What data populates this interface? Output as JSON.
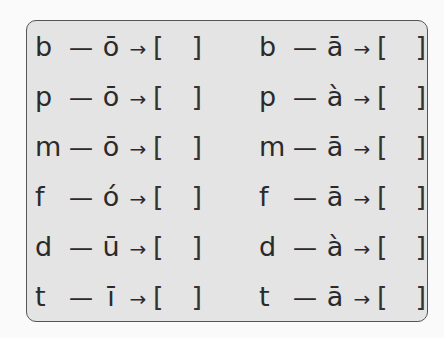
{
  "exercise": {
    "left_column": [
      {
        "initial": "b",
        "dash": "—",
        "final": "ō",
        "arrow": "→",
        "open": "[",
        "close": "]"
      },
      {
        "initial": "p",
        "dash": "—",
        "final": "ō",
        "arrow": "→",
        "open": "[",
        "close": "]"
      },
      {
        "initial": "m",
        "dash": "—",
        "final": "ō",
        "arrow": "→",
        "open": "[",
        "close": "]"
      },
      {
        "initial": "f",
        "dash": "—",
        "final": "ó",
        "arrow": "→",
        "open": "[",
        "close": "]"
      },
      {
        "initial": "d",
        "dash": "—",
        "final": "ū",
        "arrow": "→",
        "open": "[",
        "close": "]"
      },
      {
        "initial": "t",
        "dash": "—",
        "final": "ī",
        "arrow": "→",
        "open": "[",
        "close": "]"
      }
    ],
    "right_column": [
      {
        "initial": "b",
        "dash": "—",
        "final": "ā",
        "arrow": "→",
        "open": "[",
        "close": "]"
      },
      {
        "initial": "p",
        "dash": "—",
        "final": "à",
        "arrow": "→",
        "open": "[",
        "close": "]"
      },
      {
        "initial": "m",
        "dash": "—",
        "final": "ā",
        "arrow": "→",
        "open": "[",
        "close": "]"
      },
      {
        "initial": "f",
        "dash": "—",
        "final": "ā",
        "arrow": "→",
        "open": "[",
        "close": "]"
      },
      {
        "initial": "d",
        "dash": "—",
        "final": "à",
        "arrow": "→",
        "open": "[",
        "close": "]"
      },
      {
        "initial": "t",
        "dash": "—",
        "final": "ā",
        "arrow": "→",
        "open": "[",
        "close": "]"
      }
    ]
  }
}
